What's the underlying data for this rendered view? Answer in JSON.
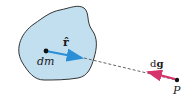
{
  "diagram": {
    "title": "",
    "body": {
      "fill": "#c2dff0",
      "stroke": "#333333"
    },
    "mass_element": {
      "label": "dm"
    },
    "unit_vector": {
      "label": "r̂",
      "color": "#2a8fd6"
    },
    "field_vector": {
      "label_prefix": "d",
      "label_bold": "g",
      "color": "#d6336c"
    },
    "point": {
      "label": "P"
    },
    "connector": {
      "style": "dashed",
      "color": "#555555"
    }
  }
}
